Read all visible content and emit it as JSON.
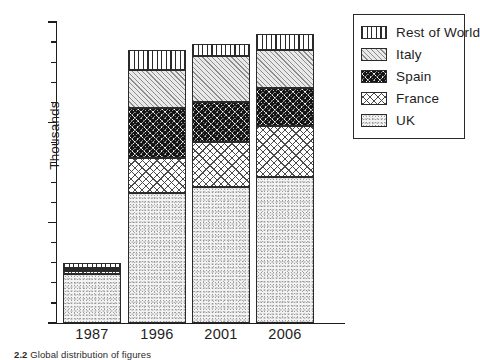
{
  "chart_data": {
    "type": "bar",
    "subtype": "stacked-vertical",
    "title": "",
    "subtitle": "",
    "xlabel": "",
    "ylabel": "Thousands",
    "categories": [
      "1987",
      "1996",
      "2001",
      "2006"
    ],
    "ylim": [
      0,
      15
    ],
    "ytick_labels": [
      "0",
      "5",
      "10",
      "15"
    ],
    "ytick_values": [
      0,
      5,
      10,
      15
    ],
    "yminor_interval": 1,
    "grid": false,
    "legend_position": "top-right-outside",
    "series": [
      {
        "name": "UK",
        "pattern": "light-stipple",
        "values": [
          2.45,
          6.5,
          6.8,
          7.3
        ]
      },
      {
        "name": "France",
        "pattern": "cross-hatch",
        "values": [
          0.15,
          1.7,
          2.2,
          2.5
        ]
      },
      {
        "name": "Spain",
        "pattern": "dense-speckle",
        "values": [
          0.1,
          2.5,
          2.0,
          1.9
        ]
      },
      {
        "name": "Italy",
        "pattern": "diagonal-hatch",
        "values": [
          0.05,
          1.9,
          2.3,
          1.9
        ]
      },
      {
        "name": "Rest of World",
        "pattern": "vertical-stripes",
        "values": [
          0.25,
          1.0,
          0.6,
          0.8
        ]
      }
    ],
    "totals": [
      3.0,
      13.6,
      13.9,
      14.4
    ]
  },
  "axes": {
    "y_title": "Thousands",
    "y_labels": [
      {
        "text": "15",
        "value": 15
      },
      {
        "text": "10",
        "value": 10
      },
      {
        "text": "5",
        "value": 5
      },
      {
        "text": "0",
        "value": 0
      }
    ],
    "x_labels": [
      "1987",
      "1996",
      "2001",
      "2006"
    ]
  },
  "legend": {
    "items": [
      {
        "label": "Rest of World",
        "pattern": "vertical-stripes"
      },
      {
        "label": "Italy",
        "pattern": "diagonal-hatch"
      },
      {
        "label": "Spain",
        "pattern": "dense-speckle"
      },
      {
        "label": "France",
        "pattern": "cross-hatch"
      },
      {
        "label": "UK",
        "pattern": "light-stipple"
      }
    ]
  },
  "caption": {
    "number": "2.2",
    "text": "Global distribution of figures"
  },
  "colors": {
    "axis": "#1d1d1d",
    "outline": "#2a2a2a",
    "background": "#ffffff",
    "italy_fill": "#e9e9e9",
    "uk_fill": "#f3f3f3"
  }
}
